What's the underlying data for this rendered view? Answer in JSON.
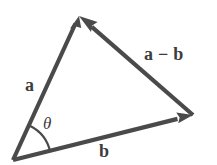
{
  "figure": {
    "kind": "vector-triangle-diagram",
    "background_color": "#ffffff",
    "stroke_color": "#4a4a4a",
    "label_color": "#3d3d3d",
    "stroke_width": 4
  },
  "labels": {
    "vector_a": "a",
    "vector_b": "b",
    "vector_a_minus_b_first": "a",
    "vector_a_minus_b_operator": "−",
    "vector_a_minus_b_second": "b",
    "angle_theta": "θ"
  },
  "geometry": {
    "origin": {
      "x": 13,
      "y": 160
    },
    "apex": {
      "x": 79,
      "y": 16
    },
    "right": {
      "x": 193,
      "y": 115
    },
    "arc_radius": 38,
    "arrow_head_length": 17,
    "arrow_head_half_width": 7
  },
  "vectors": [
    {
      "name": "a",
      "from": "origin",
      "to": "apex",
      "label": "a",
      "arrow_at": "apex"
    },
    {
      "name": "b",
      "from": "origin",
      "to": "right",
      "label": "b",
      "arrow_at": "right"
    },
    {
      "name": "a-minus-b",
      "from": "right",
      "to": "apex",
      "label": "a − b",
      "arrow_at": "apex"
    }
  ],
  "angle": {
    "symbol": "θ",
    "at": "origin",
    "between": [
      "a",
      "b"
    ]
  }
}
